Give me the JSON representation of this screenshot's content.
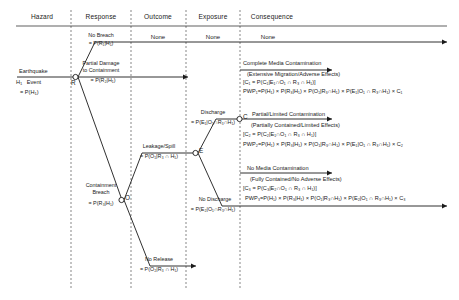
{
  "diagram": {
    "type": "event-tree",
    "columns": [
      {
        "id": "hazard",
        "label": "Hazard"
      },
      {
        "id": "response",
        "label": "Response"
      },
      {
        "id": "outcome",
        "label": "Outcome"
      },
      {
        "id": "exposure",
        "label": "Exposure"
      },
      {
        "id": "consequence",
        "label": "Consequence"
      }
    ],
    "none_labels": [
      {
        "column": "outcome",
        "label": "None"
      },
      {
        "column": "exposure",
        "label": "None"
      },
      {
        "column": "consequence",
        "label": "None"
      }
    ],
    "hazard": {
      "name": "Earthquake",
      "event_label": "H",
      "event_sub": "1",
      "event_word": "Event",
      "probability": "= P(H",
      "probability_sub": "1",
      "probability_tail": ")"
    },
    "nodes": [
      {
        "id": "R",
        "label": "R",
        "meaning": "response-node"
      },
      {
        "id": "O",
        "label": "O",
        "meaning": "outcome-node"
      },
      {
        "id": "E",
        "label": "E",
        "meaning": "exposure-node"
      },
      {
        "id": "C",
        "label": "C",
        "meaning": "consequence-node"
      }
    ],
    "branches": {
      "no_breach": {
        "name": "No Breach",
        "prob": "= P(R₁|H₁)"
      },
      "partial_damage": {
        "name": "Partial Damage",
        "name2": "to Containment",
        "prob": "= P(R₂|H₁)"
      },
      "containment_breach": {
        "name": "Containment",
        "name2": "Breach",
        "prob": "= P(R₃|H₁)"
      },
      "leakage_spill": {
        "name": "Leakage/Spill",
        "prob": "= P(O₁|R₃ ∩ H₁)"
      },
      "no_release": {
        "name": "No Release",
        "prob": "= P(O₂|R₃ ∩ H₁)"
      },
      "discharge": {
        "name": "Discharge",
        "prob": "= P(E₁|O₁∩R₃∩H₁)"
      },
      "no_discharge": {
        "name": "No Discharge",
        "prob": "= P(E₂|O₁∩R₃∩H₁)"
      }
    },
    "consequences": [
      {
        "id": "c1",
        "title": "Complete Media Contamination",
        "subtitle": "(Extensive Migration/Adverse Effects)",
        "definition": "[C₁ = P(C₁|E₁∩O₁ ∩ R₃ ∩ H₁)]",
        "formula": "PWP₁=P(H₁) × P(R₃|H₁) × P(O₁|R₃∩H₁) × P(E₁|O₁ ∩ R₃∩H₁) × C₁"
      },
      {
        "id": "c2",
        "title": "Partial/Limited Contamination",
        "subtitle": "(Partially Contained/Limited Effects)",
        "definition": "[C₂ = P(C₂|E₁∩O₁ ∩ R₃ ∩ H₁)]",
        "formula": "PWP₂=P(H₁) × P(R₃|H₁) × P(O₁|R₃∩H₁) × P(E₁|O₁ ∩ R₃∩H₁) × C₂"
      },
      {
        "id": "c3",
        "title": "No Media Contamination",
        "subtitle": "(Fully Contained/No Adverse Effects)",
        "definition": "[C₃ = P(C₃|E₂∩O₁ ∩ R₃ ∩ H₁)]",
        "formula": "PWP₃=P(H₁) × P(R₃|H₁) × P(O₁|R₃∩H₁) × P(E₂|O₁ ∩ R₃∩H₁) × C₃"
      }
    ],
    "colors": {
      "line": "#1a1a1a",
      "divider": "#555555",
      "background": "#ffffff",
      "text": "#1a1a1a"
    }
  }
}
